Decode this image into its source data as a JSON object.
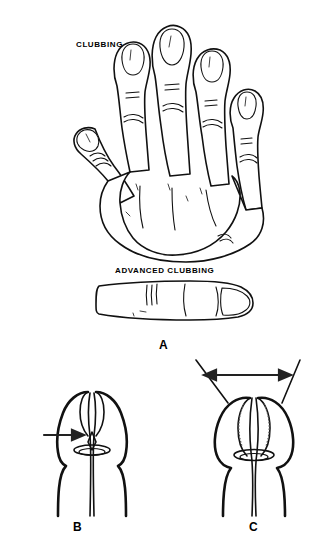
{
  "figure": {
    "background_color": "#ffffff",
    "ink_color": "#111111",
    "width": 318,
    "height": 550
  },
  "labels": {
    "clubbing": "CLUBBING",
    "advanced_clubbing": "ADVANCED CLUBBING",
    "panel_a": "A",
    "panel_b": "B",
    "panel_c": "C"
  },
  "panels": [
    {
      "id": "A",
      "letter": "A",
      "captions": [
        "CLUBBING",
        "ADVANCED CLUBBING"
      ],
      "views": [
        "dorsal-hand",
        "lateral-finger"
      ]
    },
    {
      "id": "B",
      "letter": "B",
      "annotation": "single-arrow",
      "views": [
        "opposed-fingertips-normal"
      ]
    },
    {
      "id": "C",
      "letter": "C",
      "annotation": "double-headed-angle-arrow",
      "views": [
        "opposed-fingertips-clubbed"
      ]
    }
  ]
}
